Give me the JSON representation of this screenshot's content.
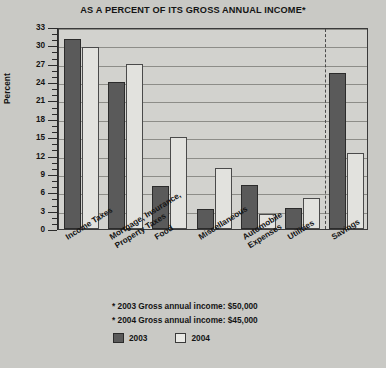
{
  "chart_data": {
    "type": "bar",
    "title": "AS A PERCENT OF ITS GROSS ANNUAL INCOME*",
    "xlabel": "",
    "ylabel": "Percent",
    "ylim": [
      0,
      33
    ],
    "ytick_step": 3,
    "yticks": [
      0,
      3,
      6,
      9,
      12,
      15,
      18,
      21,
      24,
      27,
      30,
      33
    ],
    "ytick_labels": [
      "0",
      "3",
      "6",
      "9",
      "12",
      "15",
      "18",
      "21",
      "24",
      "27",
      "30",
      "33"
    ],
    "minor_tick_step": 1,
    "grid": true,
    "legend_position": "bottom",
    "categories": [
      "Income Taxes",
      "Mortgage, Insurance, Property Taxes",
      "Food",
      "Miscellaneous",
      "Automobile Expenses",
      "Utilities",
      "Savings"
    ],
    "series": [
      {
        "name": "2003",
        "color": "#5a5a5a",
        "values": [
          31,
          24,
          7,
          3.2,
          7.2,
          3.5,
          25.5
        ]
      },
      {
        "name": "2004",
        "color": "#e2e2de",
        "values": [
          29.7,
          27,
          15,
          10,
          2.5,
          5,
          12.5
        ]
      }
    ],
    "annotations": [
      "* 2003 Gross annual income: $50,000",
      "* 2004 Gross annual income: $45,000"
    ],
    "divider_after_category_index": 5
  },
  "categories_display": [
    {
      "line1": "Income Taxes",
      "line2": ""
    },
    {
      "line1": "Mortgage, Insurance,",
      "line2": "Property Taxes"
    },
    {
      "line1": "Food",
      "line2": ""
    },
    {
      "line1": "Miscellaneous",
      "line2": ""
    },
    {
      "line1": "Automobile",
      "line2": "Expenses"
    },
    {
      "line1": "Utilities",
      "line2": ""
    },
    {
      "line1": "Savings",
      "line2": ""
    }
  ],
  "legend": {
    "items": [
      {
        "label": "2003"
      },
      {
        "label": "2004"
      }
    ]
  },
  "notes": {
    "line1": "* 2003 Gross annual income: $50,000",
    "line2": "* 2004 Gross annual income: $45,000"
  },
  "colors": {
    "background": "#c9c9c5",
    "plot_background": "#d2d2ce",
    "series_2003": "#5a5a5a",
    "series_2004": "#e2e2de",
    "gridline": "#8d8d88",
    "axis": "#2b2b2b",
    "text": "#141414"
  }
}
